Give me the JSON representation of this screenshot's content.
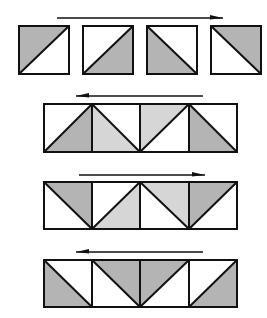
{
  "colors": {
    "background": "#ffffff",
    "stroke": "#111111",
    "shade_dark": "#b4b4b4",
    "shade_light": "#d6d6d6"
  },
  "rows": [
    {
      "id": "row-1",
      "layout": "separate",
      "arrow": {
        "direction": "right",
        "x1": 57,
        "x2": 223,
        "y": 18
      },
      "y": 26,
      "h": 48,
      "cells": [
        {
          "x": 19,
          "w": 50,
          "diagonal": "bl-tr",
          "shaded": "top-left",
          "shade": "dark"
        },
        {
          "x": 83,
          "w": 50,
          "diagonal": "bl-tr",
          "shaded": "bottom-right",
          "shade": "dark"
        },
        {
          "x": 147,
          "w": 50,
          "diagonal": "tl-br",
          "shaded": "bottom-left",
          "shade": "dark"
        },
        {
          "x": 211,
          "w": 50,
          "diagonal": "tl-br",
          "shaded": "top-right",
          "shade": "dark"
        }
      ]
    },
    {
      "id": "row-2",
      "layout": "strip",
      "arrow": {
        "direction": "left",
        "x1": 203,
        "x2": 76,
        "y": 96
      },
      "y": 104,
      "h": 48,
      "cells": [
        {
          "x": 44,
          "w": 48,
          "diagonal": "bl-tr",
          "shaded": "bottom-right",
          "shade": "dark"
        },
        {
          "x": 92,
          "w": 48,
          "diagonal": "tl-br",
          "shaded": "bottom-left",
          "shade": "light"
        },
        {
          "x": 140,
          "w": 49,
          "diagonal": "bl-tr",
          "shaded": "top-left",
          "shade": "light"
        },
        {
          "x": 189,
          "w": 48,
          "diagonal": "tl-br",
          "shaded": "bottom-left",
          "shade": "dark"
        }
      ]
    },
    {
      "id": "row-3",
      "layout": "strip",
      "arrow": {
        "direction": "right",
        "x1": 79,
        "x2": 205,
        "y": 175
      },
      "y": 182,
      "h": 47,
      "cells": [
        {
          "x": 44,
          "w": 48,
          "diagonal": "tl-br",
          "shaded": "top-right",
          "shade": "dark"
        },
        {
          "x": 92,
          "w": 48,
          "diagonal": "bl-tr",
          "shaded": "bottom-right",
          "shade": "light"
        },
        {
          "x": 140,
          "w": 49,
          "diagonal": "tl-br",
          "shaded": "top-right",
          "shade": "light"
        },
        {
          "x": 189,
          "w": 48,
          "diagonal": "bl-tr",
          "shaded": "top-left",
          "shade": "dark"
        }
      ]
    },
    {
      "id": "row-4",
      "layout": "strip",
      "arrow": {
        "direction": "left",
        "x1": 203,
        "x2": 76,
        "y": 252
      },
      "y": 260,
      "h": 47,
      "cells": [
        {
          "x": 44,
          "w": 48,
          "diagonal": "tl-br",
          "shaded": "bottom-left",
          "shade": "dark"
        },
        {
          "x": 92,
          "w": 48,
          "diagonal": "tl-br",
          "shaded": "top-right",
          "shade": "dark"
        },
        {
          "x": 140,
          "w": 49,
          "diagonal": "bl-tr",
          "shaded": "top-left",
          "shade": "dark"
        },
        {
          "x": 189,
          "w": 48,
          "diagonal": "bl-tr",
          "shaded": "bottom-right",
          "shade": "dark"
        }
      ]
    }
  ]
}
